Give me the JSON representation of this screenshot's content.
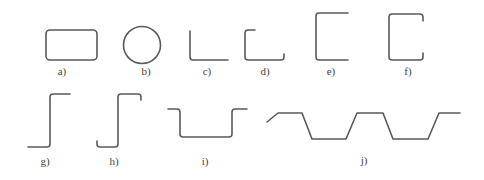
{
  "diagram": {
    "type": "cross-section profile shapes",
    "stroke_color": "#5a5a5a",
    "label_color": "#444444",
    "shapes": [
      {
        "id": "a",
        "label": "a)",
        "shape": "rounded rectangle (closed hollow section)"
      },
      {
        "id": "b",
        "label": "b)",
        "shape": "circle (tube)"
      },
      {
        "id": "c",
        "label": "c)",
        "shape": "angle (L-profile)"
      },
      {
        "id": "d",
        "label": "d)",
        "shape": "angle with lips"
      },
      {
        "id": "e",
        "label": "e)",
        "shape": "channel (C-profile)"
      },
      {
        "id": "f",
        "label": "f)",
        "shape": "lipped channel"
      },
      {
        "id": "g",
        "label": "g)",
        "shape": "Z-profile"
      },
      {
        "id": "h",
        "label": "h)",
        "shape": "lipped Z-profile"
      },
      {
        "id": "i",
        "label": "i)",
        "shape": "hat (top-hat) profile"
      },
      {
        "id": "j",
        "label": "j)",
        "shape": "trapezoidal corrugated sheet"
      }
    ]
  }
}
